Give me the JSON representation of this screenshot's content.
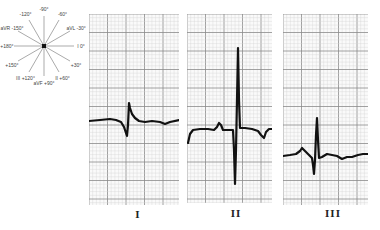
{
  "hexaxial": {
    "center": [
      44,
      46
    ],
    "radius": 30,
    "axes": [
      {
        "angle": -90,
        "label": "-90°"
      },
      {
        "angle": -120,
        "label": "-120°"
      },
      {
        "angle": -60,
        "label": "-60°"
      },
      {
        "angle": -150,
        "label": "-150°",
        "lead": "aVR"
      },
      {
        "angle": -30,
        "label": "-30°",
        "lead": "aVL"
      },
      {
        "angle": 180,
        "label": "+180°"
      },
      {
        "angle": 0,
        "label": "0°",
        "lead": "I"
      },
      {
        "angle": 150,
        "label": "+150°"
      },
      {
        "angle": 30,
        "label": "+30°"
      },
      {
        "angle": 120,
        "label": "+120°",
        "lead": "III"
      },
      {
        "angle": 90,
        "label": "+90°",
        "lead": "aVF"
      },
      {
        "angle": 60,
        "label": "+60°",
        "lead": "II"
      }
    ]
  },
  "grid": {
    "minor_px": 3.7,
    "major_every": 5,
    "minor_color": "#d4d4d4",
    "major_color": "#8a8a8a",
    "trace_color": "#111111"
  },
  "leads": [
    {
      "label": "I",
      "box": {
        "x": 89,
        "y": 14,
        "w": 90,
        "h": 191
      },
      "label_pos": {
        "x": 138,
        "y": 208
      },
      "trace": [
        [
          89,
          121
        ],
        [
          100,
          120
        ],
        [
          110,
          119
        ],
        [
          116,
          120
        ],
        [
          121,
          122
        ],
        [
          124,
          127
        ],
        [
          126,
          133
        ],
        [
          127,
          136
        ],
        [
          128,
          125
        ],
        [
          129,
          103
        ],
        [
          130,
          108
        ],
        [
          132,
          114
        ],
        [
          135,
          118
        ],
        [
          139,
          121
        ],
        [
          145,
          122
        ],
        [
          152,
          121
        ],
        [
          160,
          122
        ],
        [
          165,
          124
        ],
        [
          170,
          122
        ],
        [
          179,
          120
        ]
      ]
    },
    {
      "label": "II",
      "box": {
        "x": 187,
        "y": 14,
        "w": 85,
        "h": 189
      },
      "label_pos": {
        "x": 236,
        "y": 207
      },
      "trace": [
        [
          188,
          143
        ],
        [
          190,
          134
        ],
        [
          193,
          130
        ],
        [
          200,
          129
        ],
        [
          208,
          129
        ],
        [
          214,
          130
        ],
        [
          217,
          127
        ],
        [
          219,
          123
        ],
        [
          221,
          125
        ],
        [
          223,
          130
        ],
        [
          228,
          130
        ],
        [
          233,
          130
        ],
        [
          234,
          150
        ],
        [
          235,
          184
        ],
        [
          236,
          150
        ],
        [
          237,
          100
        ],
        [
          238,
          48
        ],
        [
          239,
          100
        ],
        [
          240,
          128
        ],
        [
          245,
          128
        ],
        [
          252,
          129
        ],
        [
          258,
          131
        ],
        [
          261,
          135
        ],
        [
          264,
          138
        ],
        [
          266,
          132
        ],
        [
          269,
          129
        ],
        [
          272,
          129
        ]
      ]
    },
    {
      "label": "III",
      "box": {
        "x": 283,
        "y": 14,
        "w": 85,
        "h": 191
      },
      "label_pos": {
        "x": 333,
        "y": 207
      },
      "trace": [
        [
          283,
          156
        ],
        [
          290,
          155
        ],
        [
          296,
          154
        ],
        [
          300,
          151
        ],
        [
          302,
          148
        ],
        [
          305,
          151
        ],
        [
          309,
          155
        ],
        [
          312,
          158
        ],
        [
          313,
          165
        ],
        [
          314,
          174
        ],
        [
          315,
          160
        ],
        [
          316,
          135
        ],
        [
          317,
          118
        ],
        [
          318,
          140
        ],
        [
          319,
          158
        ],
        [
          322,
          157
        ],
        [
          327,
          154
        ],
        [
          332,
          155
        ],
        [
          337,
          156
        ],
        [
          342,
          159
        ],
        [
          347,
          157
        ],
        [
          352,
          157
        ],
        [
          358,
          155
        ],
        [
          363,
          154
        ],
        [
          368,
          154
        ]
      ]
    }
  ]
}
